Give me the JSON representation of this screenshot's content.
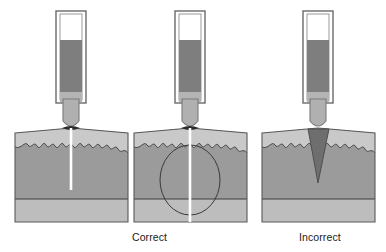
{
  "figure": {
    "width": 386,
    "height": 252,
    "background": "#ffffff"
  },
  "captions": {
    "correct": "Correct",
    "incorrect": "Incorrect"
  },
  "colors": {
    "background": "#ffffff",
    "outline": "#4c4c4c",
    "block_top_band": "#c9c9c9",
    "block_body": "#9b9b9b",
    "block_bottom_band": "#bdbdbd",
    "probe_body": "#b0b0b0",
    "probe_fill": "#7e7e7e",
    "probe_tube_white": "#ffffff",
    "couplant_correct": "#ffffff",
    "couplant_incorrect": "#6e6e6e",
    "contact_dark": "#2b2b2b",
    "beam_outline": "#3a3a3a",
    "caption_text": "#1a1a1a"
  },
  "panels": [
    {
      "id": "panel-correct-1",
      "label": "Correct",
      "verdict": "correct",
      "probe": {
        "tube_empty_height_px": 26,
        "fill_height_px": 56,
        "tip_shape": "rounded"
      },
      "couplant": {
        "type": "thin-layer",
        "color": "#ffffff",
        "description": "Thin uniform couplant film; sound path penetrates straight into material"
      },
      "beam_indicator": false,
      "penetration_depth_px": 62
    },
    {
      "id": "panel-correct-2",
      "label": "Correct",
      "verdict": "correct",
      "probe": {
        "tube_empty_height_px": 26,
        "fill_height_px": 56,
        "tip_shape": "rounded"
      },
      "couplant": {
        "type": "thin-layer",
        "color": "#ffffff",
        "description": "Thin uniform couplant film with sound beam spread shown"
      },
      "beam_indicator": true,
      "beam_shape": "ellipse",
      "penetration_depth_px": 98
    },
    {
      "id": "panel-incorrect",
      "label": "Incorrect",
      "verdict": "incorrect",
      "probe": {
        "tube_empty_height_px": 26,
        "fill_height_px": 56,
        "tip_shape": "rounded"
      },
      "couplant": {
        "type": "thick-wedge",
        "color": "#6e6e6e",
        "description": "Excess couplant forms a thick wedge that blocks sound transmission"
      },
      "beam_indicator": false,
      "penetration_depth_px": 0
    }
  ],
  "block": {
    "top_band_label": "surface layer",
    "body_label": "base material",
    "bottom_band_label": "backwall layer",
    "surface_profile": "irregular wavy interface"
  }
}
